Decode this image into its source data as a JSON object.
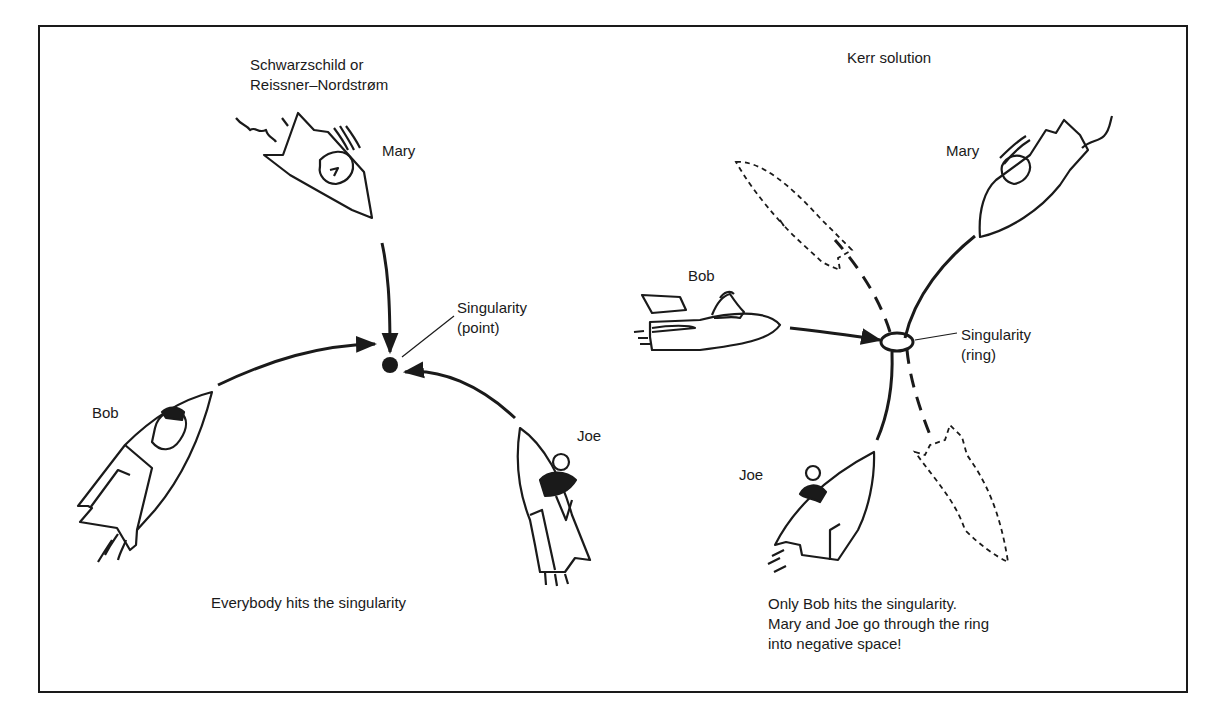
{
  "left_panel": {
    "title_line1": "Schwarzschild or",
    "title_line2": "Reissner–Nordstrøm",
    "singularity_label_line1": "Singularity",
    "singularity_label_line2": "(point)",
    "travelers": [
      {
        "name": "Mary",
        "direction": "from top"
      },
      {
        "name": "Bob",
        "direction": "from lower left"
      },
      {
        "name": "Joe",
        "direction": "from lower right"
      }
    ],
    "caption": "Everybody hits the singularity"
  },
  "right_panel": {
    "title": "Kerr solution",
    "singularity_label_line1": "Singularity",
    "singularity_label_line2": "(ring)",
    "travelers": [
      {
        "name": "Bob",
        "direction": "from left",
        "outcome": "hits singularity"
      },
      {
        "name": "Mary",
        "direction": "from upper right",
        "outcome": "passes through ring (dashed continuation)"
      },
      {
        "name": "Joe",
        "direction": "from lower left",
        "outcome": "passes through ring (dashed continuation)"
      }
    ],
    "caption_line1": "Only Bob hits the singularity.",
    "caption_line2": "Mary and Joe go through the ring",
    "caption_line3": "into negative space!"
  },
  "colors": {
    "ink": "#1a1a1a",
    "paper": "#ffffff"
  }
}
